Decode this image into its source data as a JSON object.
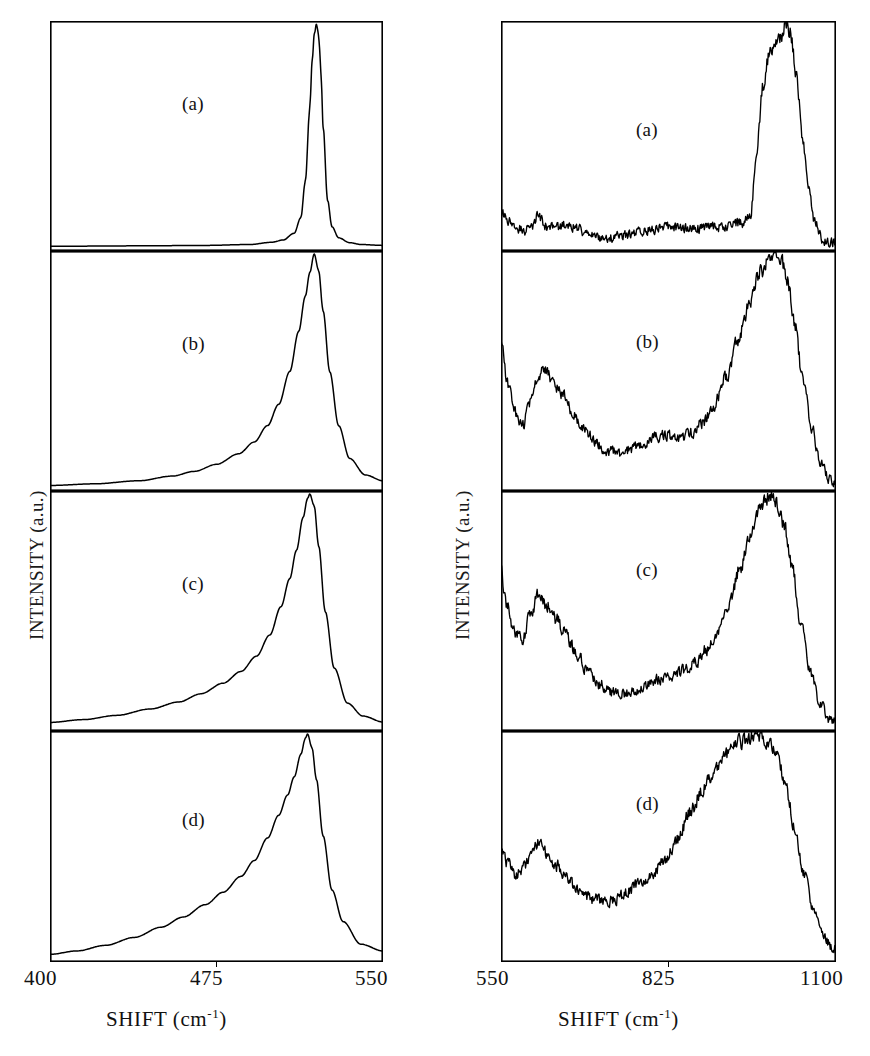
{
  "figure": {
    "background": "#ffffff",
    "ink_color": "#000000",
    "panel_count": 8
  },
  "left_group": {
    "name": "low-frequency-raman-panels",
    "ylabel": "INTENSITY (a.u.)",
    "xlabel_text": "SHIFT (cm",
    "xlabel_exponent": "-1",
    "xlabel_close": ")",
    "xticks": [
      "400",
      "475",
      "550"
    ],
    "panels": [
      {
        "label": "(a)"
      },
      {
        "label": "(b)"
      },
      {
        "label": "(c)"
      },
      {
        "label": "(d)"
      }
    ]
  },
  "right_group": {
    "name": "high-frequency-raman-panels",
    "ylabel": "INTENSITY (a.u.)",
    "xlabel_text": "SHIFT (cm",
    "xlabel_exponent": "-1",
    "xlabel_close": ")",
    "xticks": [
      "550",
      "825",
      "1100"
    ],
    "panels": [
      {
        "label": "(a)"
      },
      {
        "label": "(b)"
      },
      {
        "label": "(c)"
      },
      {
        "label": "(d)"
      }
    ]
  },
  "chart_data": [
    {
      "type": "line",
      "panel": "left-a",
      "title": "(a)",
      "xlabel": "SHIFT (cm^-1)",
      "ylabel": "INTENSITY (a.u.)",
      "xlim": [
        400,
        550
      ],
      "ylim": [
        0,
        1
      ],
      "grid": false,
      "xticks": [
        400,
        475,
        550
      ],
      "description": "Very sharp symmetric crystalline Si TO phonon peak at 520 cm^-1, FWHM about 5 cm^-1, flat zero baseline elsewhere.",
      "x": [
        400,
        440,
        470,
        490,
        500,
        505,
        510,
        513,
        515,
        517,
        518,
        519,
        520,
        521,
        522,
        523,
        525,
        527,
        530,
        535,
        540,
        550
      ],
      "y": [
        0.012,
        0.014,
        0.016,
        0.02,
        0.03,
        0.04,
        0.07,
        0.14,
        0.3,
        0.62,
        0.82,
        0.95,
        1.0,
        0.95,
        0.8,
        0.55,
        0.22,
        0.1,
        0.05,
        0.028,
        0.02,
        0.016
      ]
    },
    {
      "type": "line",
      "panel": "left-b",
      "title": "(b)",
      "xlabel": "SHIFT (cm^-1)",
      "ylabel": "INTENSITY (a.u.)",
      "xlim": [
        400,
        550
      ],
      "ylim": [
        0,
        1
      ],
      "grid": false,
      "xticks": [
        400,
        475,
        550
      ],
      "description": "Broadened asymmetric peak centred near 519 cm^-1 with a pronounced low-frequency tail.",
      "x": [
        400,
        420,
        440,
        455,
        465,
        475,
        485,
        492,
        498,
        503,
        508,
        512,
        515,
        517,
        519,
        521,
        523,
        526,
        530,
        535,
        542,
        550
      ],
      "y": [
        0.015,
        0.022,
        0.035,
        0.055,
        0.075,
        0.105,
        0.15,
        0.2,
        0.27,
        0.36,
        0.5,
        0.67,
        0.82,
        0.92,
        1.0,
        0.93,
        0.76,
        0.5,
        0.27,
        0.13,
        0.06,
        0.035
      ]
    },
    {
      "type": "line",
      "panel": "left-c",
      "title": "(c)",
      "xlabel": "SHIFT (cm^-1)",
      "ylabel": "INTENSITY (a.u.)",
      "xlim": [
        400,
        550
      ],
      "ylim": [
        0,
        1
      ],
      "grid": false,
      "xticks": [
        400,
        475,
        550
      ],
      "description": "Further broadened and slightly downshifted peak near 517 cm^-1 with a strong asymmetric low-frequency wing.",
      "x": [
        400,
        415,
        430,
        445,
        458,
        468,
        478,
        486,
        493,
        499,
        504,
        508,
        511,
        514,
        516,
        517,
        519,
        521,
        524,
        528,
        534,
        541,
        550
      ],
      "y": [
        0.028,
        0.04,
        0.058,
        0.085,
        0.115,
        0.15,
        0.195,
        0.245,
        0.31,
        0.4,
        0.52,
        0.64,
        0.76,
        0.9,
        0.98,
        1.0,
        0.95,
        0.78,
        0.5,
        0.26,
        0.11,
        0.055,
        0.03
      ]
    },
    {
      "type": "line",
      "panel": "left-d",
      "title": "(d)",
      "xlabel": "SHIFT (cm^-1)",
      "ylabel": "INTENSITY (a.u.)",
      "xlim": [
        400,
        550
      ],
      "ylim": [
        0,
        1
      ],
      "grid": false,
      "xticks": [
        400,
        475,
        550
      ],
      "description": "Broadest and most asymmetric peak, maximum near 516 cm^-1, large low-frequency shoulder extending below 450 cm^-1.",
      "x": [
        400,
        412,
        425,
        438,
        450,
        460,
        470,
        478,
        486,
        492,
        498,
        503,
        507,
        510,
        513,
        515,
        516,
        518,
        520,
        523,
        527,
        532,
        540,
        550
      ],
      "y": [
        0.025,
        0.04,
        0.065,
        0.1,
        0.145,
        0.19,
        0.245,
        0.3,
        0.37,
        0.44,
        0.54,
        0.64,
        0.73,
        0.81,
        0.91,
        0.98,
        1.0,
        0.94,
        0.8,
        0.55,
        0.31,
        0.17,
        0.07,
        0.04
      ]
    },
    {
      "type": "line",
      "panel": "right-a",
      "title": "(a)",
      "xlabel": "SHIFT (cm^-1)",
      "ylabel": "INTENSITY (a.u.)",
      "xlim": [
        550,
        1100
      ],
      "ylim": [
        0,
        1
      ],
      "grid": false,
      "xticks": [
        550,
        825,
        1100
      ],
      "description": "Low flat noisy baseline with weak features near 600, 650 and 850 cm^-1, then a steep rise to an intense flat-topped band peaking near 1010 cm^-1 and falling sharply to the baseline by 1080 cm^-1.",
      "x": [
        550,
        560,
        575,
        590,
        600,
        610,
        625,
        640,
        655,
        670,
        690,
        710,
        730,
        750,
        775,
        800,
        825,
        845,
        865,
        885,
        905,
        925,
        945,
        960,
        970,
        980,
        990,
        1000,
        1010,
        1018,
        1025,
        1035,
        1045,
        1055,
        1065,
        1080,
        1100
      ],
      "y": [
        0.17,
        0.13,
        0.09,
        0.085,
        0.1,
        0.145,
        0.1,
        0.095,
        0.105,
        0.1,
        0.07,
        0.05,
        0.05,
        0.06,
        0.075,
        0.09,
        0.1,
        0.095,
        0.09,
        0.095,
        0.1,
        0.105,
        0.115,
        0.16,
        0.45,
        0.72,
        0.86,
        0.9,
        0.93,
        1.0,
        0.96,
        0.78,
        0.5,
        0.28,
        0.12,
        0.035,
        0.03
      ]
    },
    {
      "type": "line",
      "panel": "right-b",
      "title": "(b)",
      "xlabel": "SHIFT (cm^-1)",
      "ylabel": "INTENSITY (a.u.)",
      "xlim": [
        550,
        1100
      ],
      "ylim": [
        0,
        1
      ],
      "grid": false,
      "xticks": [
        550,
        825,
        1100
      ],
      "description": "Noisy spectrum starting high at 550, a local minimum near 585, a band near 620, a broad valley 700-780, a weak bump near 840, rising to the dominant band at 1010 cm^-1.",
      "x": [
        550,
        560,
        572,
        585,
        600,
        612,
        622,
        635,
        650,
        665,
        685,
        705,
        725,
        745,
        765,
        785,
        805,
        825,
        845,
        862,
        880,
        900,
        920,
        940,
        958,
        975,
        990,
        1000,
        1010,
        1020,
        1032,
        1045,
        1060,
        1075,
        1090,
        1100
      ],
      "y": [
        0.62,
        0.46,
        0.33,
        0.27,
        0.38,
        0.48,
        0.52,
        0.45,
        0.4,
        0.34,
        0.26,
        0.2,
        0.16,
        0.155,
        0.17,
        0.2,
        0.225,
        0.23,
        0.215,
        0.235,
        0.28,
        0.36,
        0.48,
        0.64,
        0.79,
        0.92,
        0.98,
        1.0,
        0.97,
        0.88,
        0.7,
        0.48,
        0.26,
        0.11,
        0.04,
        0.02
      ]
    },
    {
      "type": "line",
      "panel": "right-c",
      "title": "(c)",
      "xlabel": "SHIFT (cm^-1)",
      "ylabel": "INTENSITY (a.u.)",
      "xlim": [
        550,
        1100
      ],
      "ylim": [
        0,
        1
      ],
      "grid": false,
      "xticks": [
        550,
        825,
        1100
      ],
      "description": "Noisier version of (b); band near 615 cm^-1, deep valley near 740, weak plateau near 840-880, strong broad band peaking near 990 cm^-1 with a shoulder on the high-frequency side.",
      "x": [
        550,
        560,
        572,
        585,
        600,
        612,
        625,
        640,
        655,
        672,
        692,
        712,
        732,
        752,
        772,
        792,
        812,
        832,
        852,
        870,
        888,
        906,
        925,
        942,
        958,
        972,
        985,
        995,
        1005,
        1015,
        1028,
        1042,
        1058,
        1075,
        1090,
        1100
      ],
      "y": [
        0.66,
        0.52,
        0.41,
        0.38,
        0.5,
        0.58,
        0.53,
        0.47,
        0.41,
        0.33,
        0.25,
        0.19,
        0.155,
        0.15,
        0.165,
        0.19,
        0.215,
        0.225,
        0.25,
        0.285,
        0.34,
        0.42,
        0.54,
        0.68,
        0.82,
        0.92,
        0.98,
        1.0,
        0.95,
        0.86,
        0.68,
        0.46,
        0.24,
        0.1,
        0.04,
        0.03
      ]
    },
    {
      "type": "line",
      "panel": "right-d",
      "title": "(d)",
      "xlabel": "SHIFT (cm^-1)",
      "ylabel": "INTENSITY (a.u.)",
      "xlim": [
        550,
        1100
      ],
      "ylim": [
        0,
        1
      ],
      "grid": false,
      "xticks": [
        550,
        825,
        1100
      ],
      "description": "Very broad amorphous-like spectrum: weak band near 610 cm^-1, minimum near 730, then a broad rounded maximum spanning 930-1000 cm^-1 decaying to near zero at 1100 cm^-1.",
      "x": [
        550,
        562,
        575,
        588,
        600,
        612,
        625,
        640,
        658,
        678,
        700,
        720,
        740,
        760,
        780,
        800,
        820,
        840,
        860,
        880,
        900,
        920,
        940,
        955,
        968,
        980,
        992,
        1005,
        1018,
        1032,
        1048,
        1065,
        1080,
        1092,
        1100
      ],
      "y": [
        0.5,
        0.42,
        0.38,
        0.42,
        0.48,
        0.52,
        0.47,
        0.42,
        0.36,
        0.3,
        0.27,
        0.26,
        0.27,
        0.31,
        0.35,
        0.39,
        0.44,
        0.54,
        0.65,
        0.75,
        0.84,
        0.91,
        0.96,
        0.98,
        1.0,
        0.99,
        0.96,
        0.89,
        0.76,
        0.58,
        0.38,
        0.21,
        0.11,
        0.06,
        0.05
      ]
    }
  ]
}
